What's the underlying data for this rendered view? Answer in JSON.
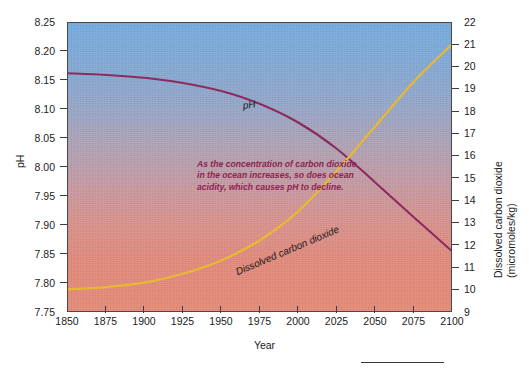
{
  "chart_data": {
    "type": "line",
    "title": "",
    "subtitle": "",
    "xlabel": "Year",
    "ylabel": "pH",
    "y2label_line1": "Dissolved carbon dioxide",
    "y2label_line2": "(micromoles/kg)",
    "xlim": [
      1850,
      2100
    ],
    "ylim": [
      7.75,
      8.25
    ],
    "y2lim": [
      9,
      22
    ],
    "grid": false,
    "legend_position": "inline-labels",
    "xticks": [
      "1850",
      "1875",
      "1900",
      "1925",
      "1950",
      "1975",
      "2000",
      "2025",
      "2050",
      "2075",
      "2100"
    ],
    "xtick_values": [
      1850,
      1875,
      1900,
      1925,
      1950,
      1975,
      2000,
      2025,
      2050,
      2075,
      2100
    ],
    "yticks_left": [
      "8.25",
      "8.20",
      "8.15",
      "8.10",
      "8.05",
      "8.00",
      "7.95",
      "7.90",
      "7.85",
      "7.80",
      "7.75"
    ],
    "ytick_left_values": [
      8.25,
      8.2,
      8.15,
      8.1,
      8.05,
      8.0,
      7.95,
      7.9,
      7.85,
      7.8,
      7.75
    ],
    "yticks_right": [
      "22",
      "21",
      "20",
      "19",
      "18",
      "17",
      "16",
      "15",
      "14",
      "13",
      "12",
      "11",
      "10",
      "9"
    ],
    "ytick_right_values": [
      22,
      21,
      20,
      19,
      18,
      17,
      16,
      15,
      14,
      13,
      12,
      11,
      10,
      9
    ],
    "annotation": "As the concentration of carbon dioxide in the ocean increases, so does ocean acidity, which causes pH to decline.",
    "series": [
      {
        "name": "pH",
        "axis": "left",
        "color": "#8c2a5e",
        "label_text": "pH",
        "x": [
          1850,
          1875,
          1900,
          1925,
          1950,
          1975,
          2000,
          2025,
          2050,
          2075,
          2100
        ],
        "values": [
          8.163,
          8.16,
          8.155,
          8.146,
          8.132,
          8.11,
          8.078,
          8.033,
          7.975,
          7.915,
          7.856
        ]
      },
      {
        "name": "Dissolved carbon dioxide",
        "axis": "right",
        "color": "#e9b832",
        "label_text": "Dissolved carbon dioxide",
        "x": [
          1850,
          1875,
          1900,
          1925,
          1950,
          1975,
          2000,
          2025,
          2050,
          2075,
          2100
        ],
        "values": [
          10.0,
          10.1,
          10.3,
          10.7,
          11.3,
          12.2,
          13.5,
          15.3,
          17.3,
          19.3,
          21.0
        ]
      }
    ],
    "background_gradient": {
      "top_color": "#74abdd",
      "bottom_color": "#e48a78"
    },
    "annotation_color": "#8e2350"
  }
}
